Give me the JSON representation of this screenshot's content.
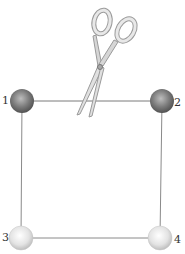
{
  "diagram": {
    "spheres": [
      {
        "id": "1",
        "label": "1",
        "shade": "dark",
        "x": 22,
        "y": 101
      },
      {
        "id": "2",
        "label": "2",
        "shade": "dark",
        "x": 162,
        "y": 101
      },
      {
        "id": "3",
        "label": "3",
        "shade": "light",
        "x": 21,
        "y": 238
      },
      {
        "id": "4",
        "label": "4",
        "shade": "light",
        "x": 160,
        "y": 238
      }
    ],
    "strings": [
      {
        "from": "1",
        "to": "2",
        "cut": true
      },
      {
        "from": "1",
        "to": "3",
        "cut": false
      },
      {
        "from": "2",
        "to": "4",
        "cut": false
      },
      {
        "from": "3",
        "to": "4",
        "cut": false
      }
    ],
    "tool": "scissors-icon",
    "colors": {
      "string": "#7a7a7a",
      "dark_sphere": "#6e6e6e",
      "light_sphere": "#d9d9d9",
      "scissors": "#b9b9b9"
    }
  }
}
